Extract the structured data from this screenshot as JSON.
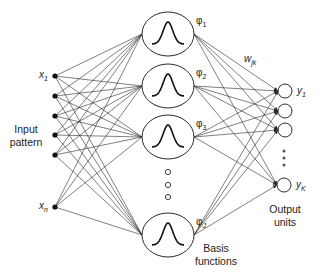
{
  "diagram": {
    "colors": {
      "stroke": "#2a2a2a",
      "background": "#ffffff",
      "text": "#222222"
    },
    "labels": {
      "input_group": [
        "Input",
        "pattern"
      ],
      "basis_group": [
        "Basis",
        "functions"
      ],
      "output_group": [
        "Output",
        "units"
      ],
      "weight": "w",
      "weight_sub": "jk"
    },
    "inputs": [
      {
        "name": "x",
        "sub": "1",
        "x": 55,
        "y": 76
      },
      {
        "name": "",
        "sub": "",
        "x": 55,
        "y": 96
      },
      {
        "name": "",
        "sub": "",
        "x": 55,
        "y": 116
      },
      {
        "name": "",
        "sub": "",
        "x": 55,
        "y": 135
      },
      {
        "name": "",
        "sub": "",
        "x": 55,
        "y": 155
      },
      {
        "name": "x",
        "sub": "n",
        "x": 55,
        "y": 207
      }
    ],
    "basis": [
      {
        "name": "φ",
        "sub": "1",
        "cx": 168,
        "cy": 34
      },
      {
        "name": "φ",
        "sub": "2",
        "cx": 168,
        "cy": 86
      },
      {
        "name": "φ",
        "sub": "3",
        "cx": 168,
        "cy": 137
      },
      {
        "name": "φ",
        "sub": "J",
        "cx": 168,
        "cy": 235
      }
    ],
    "basis_ellipsis_y": [
      172,
      185,
      197
    ],
    "outputs": [
      {
        "name": "y",
        "sub": "1",
        "cx": 285,
        "cy": 91
      },
      {
        "name": "",
        "sub": "",
        "cx": 285,
        "cy": 111
      },
      {
        "name": "",
        "sub": "",
        "cx": 285,
        "cy": 130
      },
      {
        "name": "y",
        "sub": "K",
        "cx": 284,
        "cy": 185
      }
    ],
    "output_ellipsis_y": [
      151,
      158,
      165
    ]
  }
}
